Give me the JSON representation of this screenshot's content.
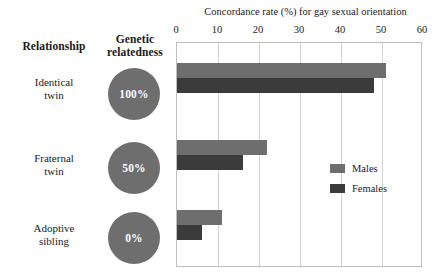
{
  "table_headers": {
    "relationship": "Relationship",
    "genetic_relatedness_line1": "Genetic",
    "genetic_relatedness_line2": "relatedness"
  },
  "rows": [
    {
      "label_line1": "Identical",
      "label_line2": "twin",
      "relatedness": "100%"
    },
    {
      "label_line1": "Fraternal",
      "label_line2": "twin",
      "relatedness": "50%"
    },
    {
      "label_line1": "Adoptive",
      "label_line2": "sibling",
      "relatedness": "0%"
    }
  ],
  "legend": {
    "males": "Males",
    "females": "Females"
  },
  "colors": {
    "males": "#6e6e6e",
    "females": "#3b3b3b",
    "circle": "#6e6e6e",
    "gridline": "#d4d4d4",
    "plot_border": "#bdbdbd"
  },
  "chart_data": {
    "type": "bar",
    "orientation": "horizontal",
    "title": "Concordance rate (%) for gay sexual orientation",
    "xlabel": "Concordance rate (%) for gay sexual orientation",
    "ylabel": "",
    "categories": [
      "Identical twin",
      "Fraternal twin",
      "Adoptive sibling"
    ],
    "series": [
      {
        "name": "Males",
        "values": [
          51,
          22,
          11
        ]
      },
      {
        "name": "Females",
        "values": [
          48,
          16,
          6
        ]
      }
    ],
    "xlim": [
      0,
      60
    ],
    "xticks": [
      0,
      10,
      20,
      30,
      40,
      50,
      60
    ],
    "xtick_labels": [
      "0",
      "10",
      "20",
      "30",
      "40",
      "50",
      "60"
    ],
    "grid": true,
    "legend_position": "center right"
  }
}
